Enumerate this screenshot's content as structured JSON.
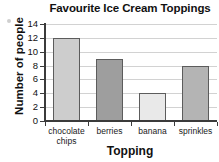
{
  "chart_data": {
    "type": "bar",
    "title": "Favourite Ice Cream Toppings",
    "xlabel": "Topping",
    "ylabel": "Number of people",
    "categories": [
      "chocolate\nchips",
      "berries",
      "banana",
      "sprinkles"
    ],
    "values": [
      12,
      9,
      4,
      8
    ],
    "ylim": [
      0,
      14
    ],
    "ytick_labels": [
      "14",
      "12",
      "10",
      "8",
      "6",
      "4",
      "2",
      "0"
    ],
    "ytick_values": [
      14,
      12,
      10,
      8,
      6,
      4,
      2,
      0
    ],
    "grid": true,
    "legend": "none",
    "bar_colors": [
      "#cdcdcd",
      "#9e9e9e",
      "#e9e9e9",
      "#b4b4b4"
    ],
    "bar_edge_color": "#5c5c5c",
    "axis_color": "#3b3b3b",
    "grid_color": "#d2d2d2",
    "bars": [
      {
        "category": "chocolate chips",
        "value": 12,
        "color": "#cdcdcd"
      },
      {
        "category": "berries",
        "value": 9,
        "color": "#9e9e9e"
      },
      {
        "category": "banana",
        "value": 4,
        "color": "#e9e9e9"
      },
      {
        "category": "sprinkles",
        "value": 8,
        "color": "#b4b4b4"
      }
    ]
  }
}
